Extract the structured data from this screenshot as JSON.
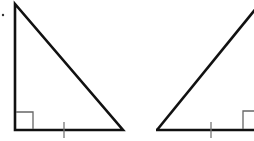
{
  "diagram": {
    "type": "geometry",
    "colors": {
      "stroke": "#111111",
      "marker": "#555555",
      "background": "#ffffff"
    },
    "triangles": [
      {
        "id": "left",
        "vertices": [
          [
            15,
            4
          ],
          [
            15,
            130
          ],
          [
            123,
            130
          ]
        ],
        "right_angle_at": [
          15,
          130
        ],
        "right_angle_marker": {
          "x": 15,
          "y": 112,
          "size": 18
        },
        "tick_on_base_x": 64
      },
      {
        "id": "right",
        "vertices": [
          [
            157,
            130
          ],
          [
            256,
            8
          ],
          [
            256,
            130
          ]
        ],
        "right_angle_at": [
          256,
          130
        ],
        "right_angle_marker": {
          "x": 243,
          "y": 111,
          "size": 19
        },
        "tick_on_base_x": 211
      }
    ],
    "edge_dot": {
      "x": 3,
      "y": 15
    }
  }
}
